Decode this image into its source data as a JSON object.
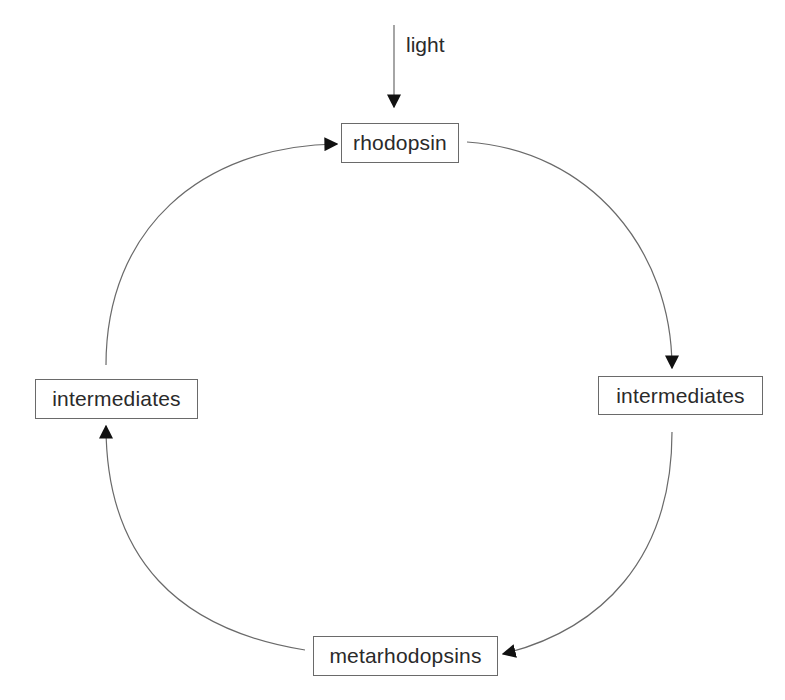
{
  "diagram": {
    "type": "cycle",
    "input": {
      "label": "light",
      "target": "rhodopsin"
    },
    "nodes": [
      {
        "id": "rhodopsin",
        "label": "rhodopsin"
      },
      {
        "id": "intermediates_right",
        "label": "intermediates"
      },
      {
        "id": "metarhodopsins",
        "label": "metarhodopsins"
      },
      {
        "id": "intermediates_left",
        "label": "intermediates"
      }
    ],
    "edges": [
      {
        "from": "rhodopsin",
        "to": "intermediates_right"
      },
      {
        "from": "intermediates_right",
        "to": "metarhodopsins"
      },
      {
        "from": "metarhodopsins",
        "to": "intermediates_left"
      },
      {
        "from": "intermediates_left",
        "to": "rhodopsin"
      }
    ],
    "colors": {
      "line": "#6a6a6a",
      "arrowhead": "#111111",
      "text": "#2a2a2a"
    }
  }
}
